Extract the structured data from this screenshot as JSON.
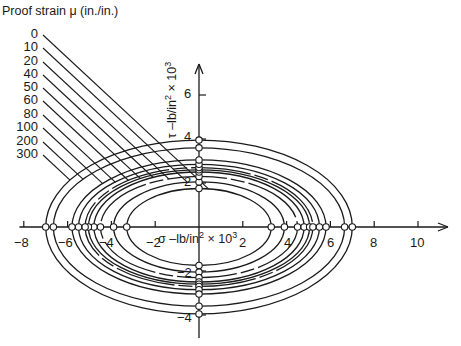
{
  "chart_data": {
    "type": "line",
    "subtype": "ellipse-family",
    "title": "Proof strain μ (in./in.)",
    "xlabel": "σ –lb/in² × 10³",
    "ylabel": "τ –lb/in² × 10³",
    "x_ticks": [
      -8,
      -6,
      -4,
      -2,
      2,
      4,
      6,
      8,
      10
    ],
    "y_ticks": [
      6,
      4,
      2,
      -2,
      -4
    ],
    "xlim": [
      -8.2,
      11.4
    ],
    "ylim": [
      -5.1,
      7.4
    ],
    "grid": false,
    "legend_position": "top-left leader lines",
    "series": [
      {
        "name": "0",
        "sigma_intercept": 3.3,
        "tau_intercept": 1.75
      },
      {
        "name": "10",
        "sigma_intercept": 3.9,
        "tau_intercept": 2.05
      },
      {
        "name": "20",
        "sigma_intercept": 4.5,
        "tau_intercept": 2.3
      },
      {
        "name": "40",
        "sigma_intercept": 4.8,
        "tau_intercept": 2.5
      },
      {
        "name": "50",
        "sigma_intercept": 5.05,
        "tau_intercept": 2.6
      },
      {
        "name": "60",
        "sigma_intercept": 5.2,
        "tau_intercept": 2.7
      },
      {
        "name": "80",
        "sigma_intercept": 5.5,
        "tau_intercept": 2.85
      },
      {
        "name": "100",
        "sigma_intercept": 5.8,
        "tau_intercept": 3.05
      },
      {
        "name": "200",
        "sigma_intercept": 6.65,
        "tau_intercept": 3.6
      },
      {
        "name": "300",
        "sigma_intercept": 7.0,
        "tau_intercept": 3.95
      }
    ]
  },
  "labels": {
    "title": "Proof strain μ (in./in.)",
    "legend": [
      "0",
      "10",
      "20",
      "40",
      "50",
      "60",
      "80",
      "100",
      "200",
      "300"
    ],
    "x_ticks": [
      "−8",
      "−6",
      "−4",
      "−2",
      "2",
      "4",
      "6",
      "8",
      "10"
    ],
    "y_ticks": [
      "6",
      "4",
      "2",
      "−2",
      "−4"
    ],
    "xlabel_main": "σ –lb/in",
    "xlabel_exp1": "2",
    "xlabel_mid": " × 10",
    "xlabel_exp2": "3",
    "ylabel_main": "τ –lb/in",
    "ylabel_exp1": "2",
    "ylabel_mid": " × 10",
    "ylabel_exp2": "3"
  }
}
